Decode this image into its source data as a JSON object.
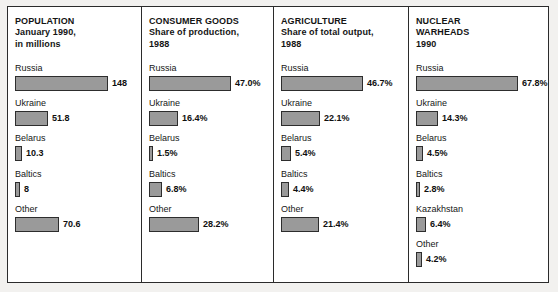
{
  "chart_data": {
    "type": "bar",
    "layout": "four side-by-side horizontal bar panels",
    "grid": false,
    "legend": "none",
    "panels": [
      {
        "id": "population",
        "title_lines": [
          "POPULATION",
          "January 1990,",
          "in millions"
        ],
        "unit": "millions",
        "ylabel": "",
        "xlabel": "",
        "categories": [
          "Russia",
          "Ukraine",
          "Belarus",
          "Baltics",
          "Other"
        ],
        "values": [
          148,
          51.8,
          10.3,
          8,
          70.6
        ],
        "value_labels": [
          "148",
          "51.8",
          "10.3",
          "8",
          "70.6"
        ],
        "max": 148,
        "bar_px": [
          93,
          33,
          7,
          5,
          44
        ]
      },
      {
        "id": "consumer-goods",
        "title_lines": [
          "CONSUMER GOODS",
          "Share of production,",
          "1988"
        ],
        "unit": "percent",
        "ylabel": "",
        "xlabel": "",
        "categories": [
          "Russia",
          "Ukraine",
          "Belarus",
          "Baltics",
          "Other"
        ],
        "values": [
          47.0,
          16.4,
          1.5,
          6.8,
          28.2
        ],
        "value_labels": [
          "47.0%",
          "16.4%",
          "1.5%",
          "6.8%",
          "28.2%"
        ],
        "max": 47.0,
        "bar_px": [
          82,
          29,
          4,
          13,
          50
        ]
      },
      {
        "id": "agriculture",
        "title_lines": [
          "AGRICULTURE",
          "Share of total output,",
          "1988"
        ],
        "unit": "percent",
        "ylabel": "",
        "xlabel": "",
        "categories": [
          "Russia",
          "Ukraine",
          "Belarus",
          "Baltics",
          "Other"
        ],
        "values": [
          46.7,
          22.1,
          5.4,
          4.4,
          21.4
        ],
        "value_labels": [
          "46.7%",
          "22.1%",
          "5.4%",
          "4.4%",
          "21.4%"
        ],
        "max": 46.7,
        "bar_px": [
          82,
          39,
          10,
          8,
          38
        ]
      },
      {
        "id": "nuclear-warheads",
        "title_lines": [
          "NUCLEAR",
          "WARHEADS",
          "1990"
        ],
        "unit": "percent",
        "ylabel": "",
        "xlabel": "",
        "categories": [
          "Russia",
          "Ukraine",
          "Belarus",
          "Baltics",
          "Kazakhstan",
          "Other"
        ],
        "values": [
          67.8,
          14.3,
          4.5,
          2.8,
          6.4,
          4.2
        ],
        "value_labels": [
          "67.8%",
          "14.3%",
          "4.5%",
          "2.8%",
          "6.4%",
          "4.2%"
        ],
        "max": 67.8,
        "bar_px": [
          102,
          22,
          7,
          4,
          10,
          6
        ]
      }
    ],
    "colors": {
      "bar_fill": "#9a9a9a",
      "bar_border": "#2d2d2d",
      "frame_border": "#2b2b2b",
      "panel_background": "#ffffff",
      "page_background": "#f2f1ef",
      "text": "#141414"
    }
  }
}
